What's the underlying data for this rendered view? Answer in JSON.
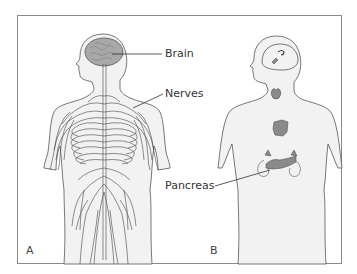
{
  "figure": {
    "panels": [
      {
        "id": "A",
        "letter": "A",
        "subject": "nervous system",
        "labels": [
          {
            "text": "Brain"
          },
          {
            "text": "Nerves"
          }
        ]
      },
      {
        "id": "B",
        "letter": "B",
        "subject": "endocrine system",
        "labels": [
          {
            "text": "Pancreas"
          }
        ]
      }
    ],
    "colors": {
      "border": "#8a8a8a",
      "body_fill": "#f2f2f2",
      "outline": "#555555",
      "organ_fill": "#9a9a9a",
      "text": "#333333"
    }
  }
}
